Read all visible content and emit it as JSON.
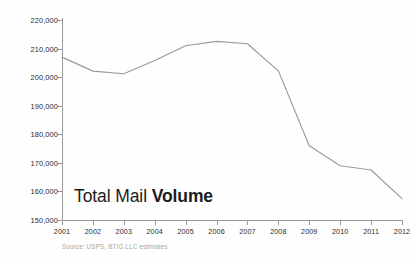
{
  "chart_data": {
    "type": "line",
    "title": "Total Mail Volume",
    "title_parts": {
      "light": "Total Mail ",
      "bold": "Volume"
    },
    "xlabel": "",
    "ylabel": "",
    "categories": [
      "2001",
      "2002",
      "2003",
      "2004",
      "2005",
      "2006",
      "2007",
      "2008",
      "2009",
      "2010",
      "2011",
      "2012"
    ],
    "x": [
      2001,
      2002,
      2003,
      2004,
      2005,
      2006,
      2007,
      2008,
      2009,
      2010,
      2011,
      2012
    ],
    "values": [
      207000,
      202100,
      201200,
      205800,
      211000,
      212500,
      211700,
      202200,
      176000,
      169000,
      167500,
      157500
    ],
    "series": [
      {
        "name": "Total Mail Volume",
        "color": "#9a9a9a",
        "values": [
          207000,
          202100,
          201200,
          205800,
          211000,
          212500,
          211700,
          202200,
          176000,
          169000,
          167500,
          157500
        ]
      }
    ],
    "ylim": [
      150000,
      220000
    ],
    "ytick_step": 10000,
    "ytick_labels": [
      "220,000",
      "210,000",
      "200,000",
      "190,000",
      "180,000",
      "170,000",
      "160,000",
      "150,000"
    ],
    "ytick_values": [
      220000,
      210000,
      200000,
      190000,
      180000,
      170000,
      160000,
      150000
    ],
    "grid": false,
    "legend": "none",
    "annotations": [
      "Total Mail Volume"
    ],
    "source": "Source: USPS, BTIG LLC estimates"
  },
  "footer": {
    "source": "Source: USPS, BTIG LLC estimates"
  },
  "style": {
    "line_color": "#9a9a9a",
    "axis_color": "#9a9a9a",
    "label_color": "#2b2b2b",
    "title_color": "#1c1c1c",
    "source_color": "#a8a8a8",
    "background": "#fefefe"
  }
}
